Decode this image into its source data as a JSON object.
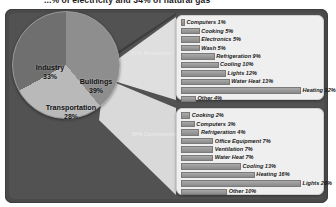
{
  "title": "...% of electricity and 34% of natural gas",
  "pie": {
    "slices": [
      {
        "name": "Industry",
        "label": "Industry",
        "percent": "33%",
        "value": 33,
        "color": "#6f6f6f"
      },
      {
        "name": "Buildings",
        "label": "Buildings",
        "percent": "39%",
        "value": 39,
        "color": "#8e8e8e"
      },
      {
        "name": "Transportation",
        "label": "Transportation",
        "percent": "28%",
        "value": 28,
        "color": "#b9b9b9"
      }
    ]
  },
  "connectors": {
    "residential": "21% Residential",
    "commercial": "18% Commercial"
  },
  "residential": {
    "rows": [
      {
        "label": "Computers 1%",
        "value": 1
      },
      {
        "label": "Cooking 5%",
        "value": 5
      },
      {
        "label": "Electronics 5%",
        "value": 5
      },
      {
        "label": "Wash 5%",
        "value": 5
      },
      {
        "label": "Refrigeration 9%",
        "value": 9
      },
      {
        "label": "Cooling 10%",
        "value": 10
      },
      {
        "label": "Lights 12%",
        "value": 12
      },
      {
        "label": "Water Heat 13%",
        "value": 13
      },
      {
        "label": "Heating 32%",
        "value": 32
      },
      {
        "label": "Other 4%",
        "value": 4
      }
    ]
  },
  "commercial": {
    "rows": [
      {
        "label": "Cooking 2%",
        "value": 2
      },
      {
        "label": "Computers 3%",
        "value": 3
      },
      {
        "label": "Refrigeration 4%",
        "value": 4
      },
      {
        "label": "Office Equipment 7%",
        "value": 7
      },
      {
        "label": "Ventilation 7%",
        "value": 7
      },
      {
        "label": "Water Heat 7%",
        "value": 7
      },
      {
        "label": "Cooling 13%",
        "value": 13
      },
      {
        "label": "Heating 16%",
        "value": 16
      },
      {
        "label": "Lights 26%",
        "value": 26
      },
      {
        "label": "Other 10%",
        "value": 10
      }
    ]
  },
  "chart_data": [
    {
      "type": "pie",
      "title": "U.S. energy consumption by sector",
      "categories": [
        "Buildings",
        "Transportation",
        "Industry"
      ],
      "values": [
        39,
        28,
        33
      ],
      "labels": [
        "Buildings 39%",
        "Transportation 28%",
        "Industry 33%"
      ],
      "unit": "percent",
      "legend": "none"
    },
    {
      "type": "bar",
      "orientation": "horizontal",
      "title": "21% Residential",
      "categories": [
        "Computers",
        "Cooking",
        "Electronics",
        "Wash",
        "Refrigeration",
        "Cooling",
        "Lights",
        "Water Heat",
        "Heating",
        "Other"
      ],
      "values": [
        1,
        5,
        5,
        5,
        9,
        10,
        12,
        13,
        32,
        4
      ],
      "xlabel": "",
      "ylabel": "",
      "xlim": [
        0,
        32
      ],
      "grid": false,
      "legend": "none"
    },
    {
      "type": "bar",
      "orientation": "horizontal",
      "title": "18% Commercial",
      "categories": [
        "Cooking",
        "Computers",
        "Refrigeration",
        "Office Equipment",
        "Ventilation",
        "Water Heat",
        "Cooling",
        "Heating",
        "Lights",
        "Other"
      ],
      "values": [
        2,
        3,
        4,
        7,
        7,
        7,
        13,
        16,
        26,
        10
      ],
      "xlabel": "",
      "ylabel": "",
      "xlim": [
        0,
        26
      ],
      "grid": false,
      "legend": "none"
    }
  ],
  "colors": {
    "board": "#4a4a4a",
    "panel": "#efefef",
    "bar": "#9a9a9a",
    "slice_buildings": "#8e8e8e",
    "slice_transportation": "#b9b9b9",
    "slice_industry": "#6f6f6f"
  }
}
